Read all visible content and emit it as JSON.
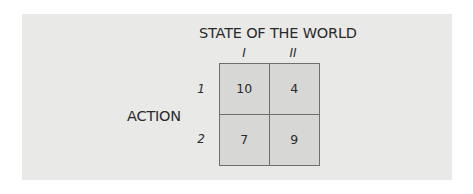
{
  "diagram": {
    "title": "STATE OF THE WORLD",
    "row_title": "ACTION",
    "columns": [
      "I",
      "II"
    ],
    "rows": [
      "1",
      "2"
    ],
    "payoffs": [
      [
        "10",
        "4"
      ],
      [
        "7",
        "9"
      ]
    ]
  },
  "colors": {
    "panel_background": "#e9e9e8",
    "cell_fill": "#d7d7d6",
    "grid_line": "#6e6e6e",
    "text": "#2a2a2a"
  }
}
